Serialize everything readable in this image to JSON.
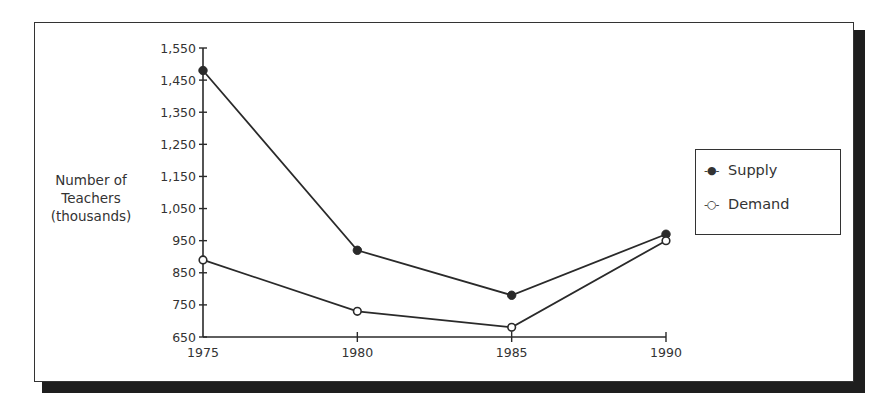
{
  "chart_data": {
    "type": "line",
    "title": "",
    "xlabel": "",
    "ylabel": "Number of Teachers (thousands)",
    "ylabel_lines": [
      "Number of",
      "Teachers",
      "(thousands)"
    ],
    "x": [
      1975,
      1980,
      1985,
      1990
    ],
    "x_tick_labels": [
      "1975",
      "1980",
      "1985",
      "1990"
    ],
    "y_tick_labels": [
      "1,550",
      "1,450",
      "1,350",
      "1,250",
      "1,150",
      "1,050",
      "950",
      "850",
      "750",
      "650"
    ],
    "y_ticks": [
      1550,
      1450,
      1350,
      1250,
      1150,
      1050,
      950,
      850,
      750,
      650
    ],
    "ylim": [
      650,
      1550
    ],
    "xlim": [
      1975,
      1990
    ],
    "grid": false,
    "legend_position": "right",
    "series": [
      {
        "name": "Supply",
        "marker": "filled-circle",
        "values": [
          1480,
          920,
          780,
          970
        ]
      },
      {
        "name": "Demand",
        "marker": "open-circle",
        "values": [
          890,
          730,
          680,
          950
        ]
      }
    ]
  },
  "legend": {
    "items": [
      {
        "label": "Supply",
        "marker": "-●-"
      },
      {
        "label": "Demand",
        "marker": "-○-"
      }
    ]
  },
  "colors": {
    "line": "#2a2a2a",
    "frame": "#333333",
    "shadow": "#1e1e1e",
    "background": "#ffffff"
  }
}
